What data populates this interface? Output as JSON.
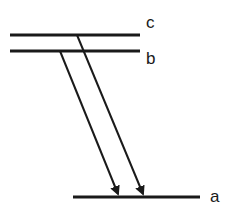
{
  "diagram": {
    "type": "energy-level-diagram",
    "levels": [
      {
        "id": "c",
        "label": "c",
        "y": 35,
        "x1": 10,
        "x2": 140
      },
      {
        "id": "b",
        "label": "b",
        "y": 51,
        "x1": 10,
        "x2": 140
      },
      {
        "id": "a",
        "label": "a",
        "y": 197,
        "x1": 73,
        "x2": 200
      }
    ],
    "transitions": [
      {
        "from": "b",
        "to": "a",
        "x1": 60,
        "y1": 51,
        "x2": 118,
        "y2": 196
      },
      {
        "from": "c",
        "to": "a",
        "x1": 77,
        "y1": 35,
        "x2": 143,
        "y2": 196
      }
    ],
    "colors": {
      "line": "#1a1a1a",
      "background": "#ffffff"
    }
  }
}
